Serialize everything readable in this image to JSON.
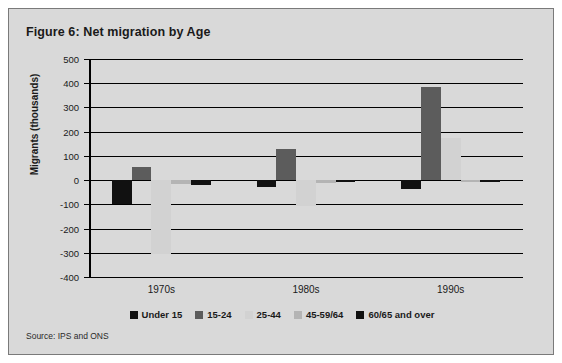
{
  "figure": {
    "title": "Figure 6: Net migration by Age",
    "source": "Source: IPS and ONS"
  },
  "chart_data": {
    "type": "bar",
    "title": "Figure 6: Net migration by Age",
    "xlabel": "",
    "ylabel": "Migrants (thousands)",
    "ylim": [
      -400,
      500
    ],
    "ytick_step": 100,
    "grid": true,
    "legend_position": "bottom",
    "categories": [
      "1970s",
      "1980s",
      "1990s"
    ],
    "ytick_labels": [
      "500",
      "400",
      "300",
      "200",
      "100",
      "0",
      "-100",
      "-200",
      "-300",
      "-400"
    ],
    "series": [
      {
        "name": "Under 15",
        "color": "#111111",
        "values": [
          -98,
          -28,
          -38
        ]
      },
      {
        "name": "15-24",
        "color": "#5c5c5c",
        "values": [
          55,
          130,
          385
        ]
      },
      {
        "name": "25-44",
        "color": "#d2d2d2",
        "values": [
          -305,
          -105,
          175
        ]
      },
      {
        "name": "45-59/64",
        "color": "#b4b4b4",
        "values": [
          -18,
          -12,
          -8
        ]
      },
      {
        "name": "60/65 and over",
        "color": "#111111",
        "values": [
          -20,
          -8,
          -5
        ]
      }
    ]
  },
  "colors": {
    "panel_background": "#d9d9d9",
    "panel_border": "#7a7a7a",
    "axis": "#000000",
    "text": "#1a1a1a"
  }
}
